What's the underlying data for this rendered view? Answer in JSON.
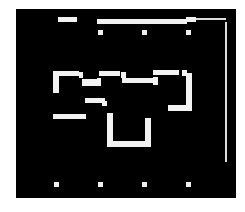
{
  "board": {
    "x": 16,
    "y": 9,
    "width": 220,
    "height": 189,
    "background": "#000000",
    "foreground": "#f2f2f2"
  },
  "walls": [
    {
      "x": 58,
      "y": 17,
      "w": 19,
      "h": 5
    },
    {
      "x": 97,
      "y": 19,
      "w": 90,
      "h": 5
    },
    {
      "x": 186,
      "y": 17,
      "w": 10,
      "h": 5
    },
    {
      "x": 53,
      "y": 71,
      "w": 26,
      "h": 5
    },
    {
      "x": 53,
      "y": 76,
      "w": 6,
      "h": 17
    },
    {
      "x": 79,
      "y": 72,
      "w": 4,
      "h": 6
    },
    {
      "x": 82,
      "y": 79,
      "w": 16,
      "h": 7
    },
    {
      "x": 97,
      "y": 78,
      "w": 4,
      "h": 8
    },
    {
      "x": 99,
      "y": 71,
      "w": 21,
      "h": 5
    },
    {
      "x": 121,
      "y": 72,
      "w": 5,
      "h": 6
    },
    {
      "x": 122,
      "y": 78,
      "w": 32,
      "h": 5
    },
    {
      "x": 153,
      "y": 77,
      "w": 5,
      "h": 8
    },
    {
      "x": 153,
      "y": 70,
      "w": 26,
      "h": 5
    },
    {
      "x": 182,
      "y": 70,
      "w": 5,
      "h": 6
    },
    {
      "x": 186,
      "y": 73,
      "w": 6,
      "h": 34
    },
    {
      "x": 168,
      "y": 105,
      "w": 24,
      "h": 6
    },
    {
      "x": 85,
      "y": 98,
      "w": 20,
      "h": 5
    },
    {
      "x": 102,
      "y": 101,
      "w": 5,
      "h": 5
    },
    {
      "x": 53,
      "y": 114,
      "w": 33,
      "h": 5
    },
    {
      "x": 107,
      "y": 113,
      "w": 6,
      "h": 34
    },
    {
      "x": 113,
      "y": 141,
      "w": 38,
      "h": 6
    },
    {
      "x": 145,
      "y": 118,
      "w": 6,
      "h": 23
    }
  ],
  "rails": [
    {
      "x": 196,
      "y": 18,
      "w": 30,
      "h": 2
    },
    {
      "x": 225,
      "y": 22,
      "w": 2,
      "h": 140
    }
  ],
  "dots": [
    {
      "x": 98,
      "y": 30
    },
    {
      "x": 142,
      "y": 30
    },
    {
      "x": 186,
      "y": 30
    },
    {
      "x": 54,
      "y": 182
    },
    {
      "x": 98,
      "y": 182
    },
    {
      "x": 142,
      "y": 182
    },
    {
      "x": 186,
      "y": 182
    }
  ]
}
